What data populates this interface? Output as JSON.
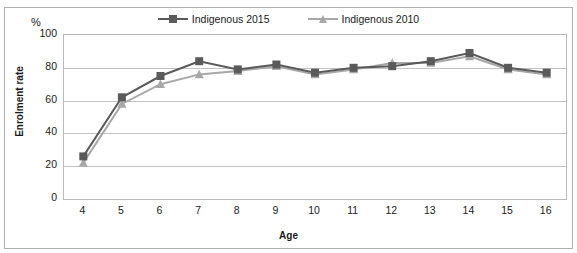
{
  "top_cut_caption": "",
  "chart_data": {
    "type": "line",
    "title": "",
    "xlabel": "Age",
    "ylabel": "Enrolment rate",
    "unit_label": "%",
    "categories": [
      4,
      5,
      6,
      7,
      8,
      9,
      10,
      11,
      12,
      13,
      14,
      15,
      16
    ],
    "x_tick_labels": [
      "4",
      "5",
      "6",
      "7",
      "8",
      "9",
      "10",
      "11",
      "12",
      "13",
      "14",
      "15",
      "16"
    ],
    "y_tick_labels": [
      "0",
      "20",
      "40",
      "60",
      "80",
      "100"
    ],
    "y_ticks": [
      0,
      20,
      40,
      60,
      80,
      100
    ],
    "ylim": [
      0,
      100
    ],
    "grid": true,
    "legend_position": "top-center",
    "series": [
      {
        "name": "Indigenous 2015",
        "color": "#5a5a5a",
        "marker": "square",
        "values": [
          26,
          62,
          75,
          84,
          79,
          82,
          77,
          80,
          81,
          84,
          89,
          80,
          77
        ]
      },
      {
        "name": "Indigenous 2010",
        "color": "#a8a8a8",
        "marker": "triangle",
        "values": [
          22,
          58,
          70,
          76,
          78,
          81,
          76,
          79,
          83,
          83,
          87,
          79,
          76
        ]
      }
    ]
  }
}
